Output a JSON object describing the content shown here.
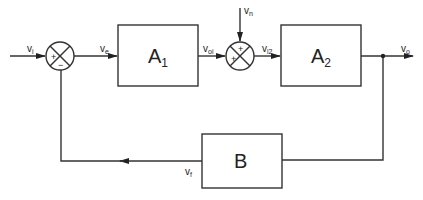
{
  "diagram": {
    "type": "block-diagram",
    "blocks": [
      {
        "id": "A1",
        "label": "A",
        "sub": "1"
      },
      {
        "id": "A2",
        "label": "A",
        "sub": "2"
      },
      {
        "id": "B",
        "label": "B",
        "sub": ""
      }
    ],
    "summing_junctions": [
      {
        "id": "sum1",
        "signs": {
          "left": "+",
          "bottom": "−"
        }
      },
      {
        "id": "sum2",
        "signs": {
          "top": "+",
          "left": "+"
        }
      }
    ],
    "signals": {
      "vi": {
        "label": "v",
        "sub": "i"
      },
      "ve": {
        "label": "v",
        "sub": "e"
      },
      "voi": {
        "label": "v",
        "sub": "oi"
      },
      "vn": {
        "label": "v",
        "sub": "n"
      },
      "vi2": {
        "label": "v",
        "sub": "i2"
      },
      "vo": {
        "label": "v",
        "sub": "o"
      },
      "vf": {
        "label": "v",
        "sub": "f"
      }
    },
    "connections": [
      "vi -> sum1(+)",
      "sum1 -> ve -> A1",
      "A1 -> voi -> sum2(+)",
      "vn -> sum2(+)",
      "sum2 -> vi2 -> A2",
      "A2 -> vo",
      "vo -> B -> vf -> sum1(−)"
    ]
  }
}
